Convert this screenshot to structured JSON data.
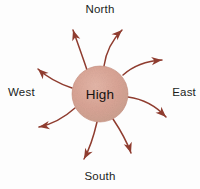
{
  "diagram": {
    "center": {
      "label": "High",
      "fill_color": "#d6a092",
      "edge_color": "#c08878",
      "cx": 100,
      "cy": 94,
      "r": 28
    },
    "direction_labels": {
      "north": "North",
      "east": "East",
      "south": "South",
      "west": "West"
    },
    "arrow_color": "#8f3c2f",
    "arrow_count": 8,
    "arrows": [
      {
        "name": "arrow-north-northeast",
        "path": "M 104 66 C 106 52 112 40 122 30",
        "tip": {
          "x": 122,
          "y": 30
        },
        "angle": -44
      },
      {
        "name": "arrow-northeast-east",
        "path": "M 123 75 C 133 66 146 61 162 60",
        "tip": {
          "x": 162,
          "y": 60
        },
        "angle": -6
      },
      {
        "name": "arrow-east-southeast",
        "path": "M 128 97 C 143 99 156 106 166 117",
        "tip": {
          "x": 166,
          "y": 117
        },
        "angle": 44
      },
      {
        "name": "arrow-south-southeast",
        "path": "M 113 119 C 121 131 127 142 131 153",
        "tip": {
          "x": 131,
          "y": 153
        },
        "angle": 72
      },
      {
        "name": "arrow-south-southwest",
        "path": "M 97 122 C 94 135 90 148 84 159",
        "tip": {
          "x": 84,
          "y": 159
        },
        "angle": 118
      },
      {
        "name": "arrow-southwest-west",
        "path": "M 75 108 C 65 117 53 124 39 127",
        "tip": {
          "x": 39,
          "y": 127
        },
        "angle": 170
      },
      {
        "name": "arrow-west-northwest",
        "path": "M 72 88 C 60 84 48 78 38 69",
        "tip": {
          "x": 38,
          "y": 69
        },
        "angle": -137
      },
      {
        "name": "arrow-northwest-north",
        "path": "M 87 70 C 83 58 78 44 73 30",
        "tip": {
          "x": 73,
          "y": 30
        },
        "angle": -108
      }
    ]
  }
}
